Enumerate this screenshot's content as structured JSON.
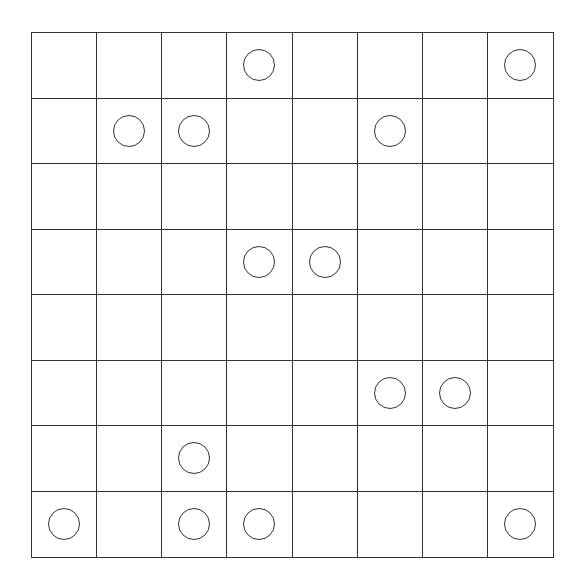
{
  "grid": {
    "rows": 8,
    "cols": 8,
    "line_color": "#333333",
    "background": "#ffffff",
    "cells": [
      [
        0,
        0,
        0,
        1,
        0,
        0,
        0,
        1
      ],
      [
        0,
        1,
        1,
        0,
        0,
        1,
        0,
        0
      ],
      [
        0,
        0,
        0,
        0,
        0,
        0,
        0,
        0
      ],
      [
        0,
        0,
        0,
        1,
        1,
        0,
        0,
        0
      ],
      [
        0,
        0,
        0,
        0,
        0,
        0,
        0,
        0
      ],
      [
        0,
        0,
        0,
        0,
        0,
        1,
        1,
        0
      ],
      [
        0,
        0,
        1,
        0,
        0,
        0,
        0,
        0
      ],
      [
        1,
        0,
        1,
        1,
        0,
        0,
        0,
        1
      ]
    ],
    "marker": "circle-icon"
  }
}
